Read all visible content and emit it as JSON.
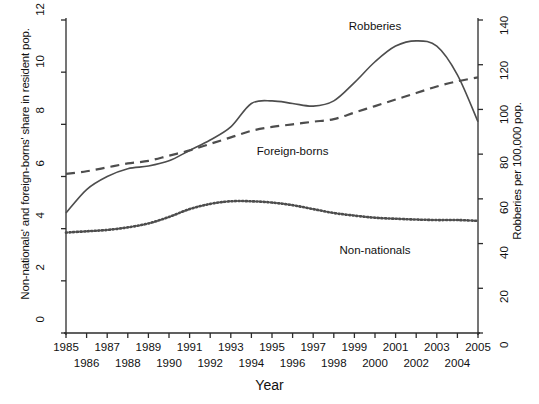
{
  "chart_data": {
    "type": "line",
    "title": "",
    "xlabel": "Year",
    "ylabel": "Non-nationals' and foreign-borns' share in resident pop.",
    "y2label": "Robberies per 100,000 pop.",
    "xlim": [
      1985,
      2005
    ],
    "ylim": [
      0,
      12
    ],
    "y2lim": [
      0,
      140
    ],
    "grid": false,
    "legend_position": "inline-annotations",
    "x": [
      1985,
      1986,
      1987,
      1988,
      1989,
      1990,
      1991,
      1992,
      1993,
      1994,
      1995,
      1996,
      1997,
      1998,
      1999,
      2000,
      2001,
      2002,
      2003,
      2004,
      2005
    ],
    "xticklabels_top": [
      "1985",
      "1987",
      "1989",
      "1991",
      "1993",
      "1995",
      "1997",
      "1999",
      "2001",
      "2003",
      "2005"
    ],
    "xticklabels_bottom": [
      "1986",
      "1988",
      "1990",
      "1992",
      "1994",
      "1996",
      "1998",
      "2000",
      "2002",
      "2004"
    ],
    "yticklabels": [
      "0",
      "2",
      "4",
      "6",
      "8",
      "10",
      "12"
    ],
    "y2ticklabels": [
      "0",
      "20",
      "40",
      "60",
      "80",
      "100",
      "120",
      "140"
    ],
    "series": [
      {
        "name": "Robberies",
        "axis": "right",
        "style": "solid",
        "color": "#4d4d4d",
        "units": "per 100,000 pop.",
        "values_right_axis": [
          54,
          64,
          70,
          73,
          75,
          77,
          81,
          86,
          92,
          103,
          104,
          103,
          102,
          104,
          112,
          121,
          128,
          131,
          128,
          116,
          95
        ],
        "values_left_equivalent": [
          4.6,
          5.5,
          6.0,
          6.3,
          6.4,
          6.6,
          7.0,
          7.4,
          7.9,
          8.8,
          8.9,
          8.8,
          8.7,
          8.9,
          9.6,
          10.4,
          11.0,
          11.2,
          11.0,
          9.9,
          8.1
        ]
      },
      {
        "name": "Foreign-borns",
        "axis": "left",
        "style": "dashed",
        "color": "#333333",
        "units": "share in resident pop. (%)",
        "values": [
          6.1,
          6.2,
          6.35,
          6.5,
          6.6,
          6.8,
          7.0,
          7.25,
          7.5,
          7.75,
          7.9,
          8.0,
          8.1,
          8.2,
          8.45,
          8.7,
          8.95,
          9.2,
          9.45,
          9.65,
          9.8
        ]
      },
      {
        "name": "Non-nationals",
        "axis": "left",
        "style": "dotted",
        "color": "#1a1a1a",
        "units": "share in resident pop. (%)",
        "values": [
          3.85,
          3.9,
          3.95,
          4.05,
          4.2,
          4.45,
          4.75,
          4.95,
          5.05,
          5.05,
          5.0,
          4.9,
          4.75,
          4.6,
          4.5,
          4.42,
          4.38,
          4.35,
          4.33,
          4.33,
          4.3
        ]
      }
    ],
    "annotations": [
      {
        "text": "Robberies",
        "x": 2000,
        "y_left": 11.7
      },
      {
        "text": "Foreign-borns",
        "x": 1996,
        "y_left": 6.9
      },
      {
        "text": "Non-nationals",
        "x": 2000,
        "y_left": 3.1
      }
    ]
  }
}
